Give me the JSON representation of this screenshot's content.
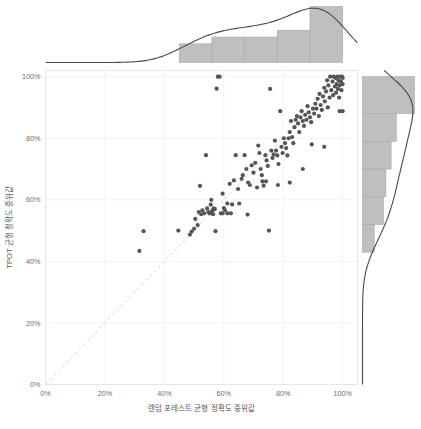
{
  "chart_data": {
    "type": "scatter",
    "title": "",
    "xlabel": "랜덤 포레스트 균형 정확도 중위값",
    "ylabel": "TPOT 균형 정확도 중위값",
    "xlim": [
      0,
      1.05
    ],
    "ylim": [
      0,
      1.02
    ],
    "x_ticks": [
      0,
      0.2,
      0.4,
      0.6,
      0.8,
      1.0
    ],
    "y_ticks": [
      0,
      0.2,
      0.4,
      0.6,
      0.8,
      1.0
    ],
    "x_tick_labels": [
      "0%",
      "20%",
      "40%",
      "60%",
      "80%",
      "100%"
    ],
    "y_tick_labels": [
      "0%",
      "20%",
      "40%",
      "60%",
      "80%",
      "100%"
    ],
    "grid": true,
    "legend": "none",
    "annotations": [
      {
        "type": "reference-line",
        "label": "y = x identity line",
        "style": "dashed",
        "color": "#d8d2d2"
      }
    ],
    "marker_color": "#555555",
    "marker_size": 2.1,
    "points": [
      [
        0.316,
        0.434
      ],
      [
        0.33,
        0.498
      ],
      [
        0.447,
        0.5
      ],
      [
        0.486,
        0.487
      ],
      [
        0.492,
        0.497
      ],
      [
        0.5,
        0.506
      ],
      [
        0.504,
        0.538
      ],
      [
        0.512,
        0.518
      ],
      [
        0.516,
        0.56
      ],
      [
        0.52,
        0.645
      ],
      [
        0.524,
        0.553
      ],
      [
        0.528,
        0.566
      ],
      [
        0.534,
        0.556
      ],
      [
        0.54,
        0.745
      ],
      [
        0.544,
        0.572
      ],
      [
        0.548,
        0.56
      ],
      [
        0.552,
        0.556
      ],
      [
        0.556,
        0.584
      ],
      [
        0.558,
        0.6
      ],
      [
        0.56,
        0.559
      ],
      [
        0.562,
        0.566
      ],
      [
        0.564,
        0.553
      ],
      [
        0.566,
        0.572
      ],
      [
        0.57,
        0.57
      ],
      [
        0.572,
        0.498
      ],
      [
        0.576,
        0.961
      ],
      [
        0.58,
        1.0
      ],
      [
        0.586,
        1.0
      ],
      [
        0.59,
        0.556
      ],
      [
        0.596,
        0.62
      ],
      [
        0.6,
        0.573
      ],
      [
        0.604,
        0.566
      ],
      [
        0.612,
        0.588
      ],
      [
        0.62,
        0.652
      ],
      [
        0.628,
        0.585
      ],
      [
        0.634,
        0.663
      ],
      [
        0.64,
        0.745
      ],
      [
        0.648,
        0.635
      ],
      [
        0.652,
        0.588
      ],
      [
        0.66,
        0.668
      ],
      [
        0.664,
        0.68
      ],
      [
        0.67,
        0.745
      ],
      [
        0.676,
        0.7
      ],
      [
        0.682,
        0.656
      ],
      [
        0.688,
        0.648
      ],
      [
        0.694,
        0.712
      ],
      [
        0.7,
        0.688
      ],
      [
        0.706,
        0.72
      ],
      [
        0.712,
        0.64
      ],
      [
        0.716,
        0.776
      ],
      [
        0.72,
        0.752
      ],
      [
        0.724,
        0.7
      ],
      [
        0.728,
        0.68
      ],
      [
        0.73,
        0.66
      ],
      [
        0.734,
        0.646
      ],
      [
        0.74,
        0.745
      ],
      [
        0.744,
        0.728
      ],
      [
        0.748,
        0.71
      ],
      [
        0.752,
        0.5
      ],
      [
        0.756,
        0.96
      ],
      [
        0.76,
        0.76
      ],
      [
        0.764,
        0.736
      ],
      [
        0.768,
        0.748
      ],
      [
        0.772,
        0.792
      ],
      [
        0.776,
        0.76
      ],
      [
        0.78,
        0.744
      ],
      [
        0.784,
        0.716
      ],
      [
        0.79,
        0.888
      ],
      [
        0.794,
        0.772
      ],
      [
        0.798,
        0.752
      ],
      [
        0.802,
        0.8
      ],
      [
        0.806,
        0.784
      ],
      [
        0.81,
        0.768
      ],
      [
        0.814,
        0.744
      ],
      [
        0.818,
        0.8
      ],
      [
        0.822,
        0.82
      ],
      [
        0.826,
        0.856
      ],
      [
        0.83,
        0.804
      ],
      [
        0.834,
        0.784
      ],
      [
        0.838,
        0.836
      ],
      [
        0.842,
        0.86
      ],
      [
        0.846,
        0.872
      ],
      [
        0.85,
        0.848
      ],
      [
        0.854,
        0.82
      ],
      [
        0.858,
        0.868
      ],
      [
        0.862,
        0.888
      ],
      [
        0.866,
        0.856
      ],
      [
        0.87,
        0.84
      ],
      [
        0.874,
        0.876
      ],
      [
        0.878,
        0.86
      ],
      [
        0.882,
        0.904
      ],
      [
        0.886,
        0.884
      ],
      [
        0.89,
        0.868
      ],
      [
        0.894,
        0.852
      ],
      [
        0.896,
        0.78
      ],
      [
        0.9,
        0.896
      ],
      [
        0.904,
        0.88
      ],
      [
        0.908,
        0.912
      ],
      [
        0.912,
        0.896
      ],
      [
        0.916,
        0.928
      ],
      [
        0.92,
        0.872
      ],
      [
        0.922,
        0.944
      ],
      [
        0.926,
        0.908
      ],
      [
        0.93,
        0.892
      ],
      [
        0.934,
        0.936
      ],
      [
        0.938,
        0.964
      ],
      [
        0.94,
        0.92
      ],
      [
        0.944,
        0.952
      ],
      [
        0.948,
        0.988
      ],
      [
        0.95,
        0.9
      ],
      [
        0.952,
        0.972
      ],
      [
        0.956,
        0.932
      ],
      [
        0.958,
        1.0
      ],
      [
        0.962,
        0.956
      ],
      [
        0.966,
        0.984
      ],
      [
        0.968,
        0.94
      ],
      [
        0.97,
        1.0
      ],
      [
        0.974,
        0.968
      ],
      [
        0.976,
        0.996
      ],
      [
        0.978,
        0.948
      ],
      [
        0.98,
        0.976
      ],
      [
        0.982,
        1.0
      ],
      [
        0.984,
        0.96
      ],
      [
        0.986,
        0.988
      ],
      [
        0.988,
        0.932
      ],
      [
        0.99,
        0.972
      ],
      [
        0.992,
        1.0
      ],
      [
        0.994,
        0.984
      ],
      [
        0.996,
        0.956
      ],
      [
        0.998,
        1.0
      ],
      [
        1.0,
        0.996
      ],
      [
        1.0,
        0.976
      ],
      [
        1.0,
        0.888
      ],
      [
        0.99,
        0.888
      ],
      [
        0.938,
        0.772
      ],
      [
        0.866,
        0.7
      ],
      [
        0.822,
        0.656
      ],
      [
        0.782,
        0.648
      ],
      [
        0.742,
        0.66
      ],
      [
        0.68,
        0.552
      ],
      [
        0.624,
        0.556
      ],
      [
        0.612,
        0.556
      ],
      [
        0.596,
        0.556
      ]
    ],
    "top_marginal": {
      "type": "histogram",
      "orientation": "vertical",
      "bin_edges": [
        0.45,
        0.56,
        0.67,
        0.78,
        0.89,
        1.0
      ],
      "counts": [
        11,
        15,
        15,
        19,
        33
      ],
      "density_curve": true,
      "fill_color": "#bfbfbf",
      "line_color": "#4a4a4a"
    },
    "right_marginal": {
      "type": "histogram",
      "orientation": "horizontal",
      "bin_edges": [
        0.43,
        0.52,
        0.61,
        0.7,
        0.79,
        0.88,
        1.0
      ],
      "counts": [
        9,
        16,
        18,
        22,
        26,
        40
      ],
      "density_curve": true,
      "fill_color": "#bfbfbf",
      "line_color": "#4a4a4a"
    }
  },
  "colors": {
    "background": "#ffffff",
    "grid": "#f0f0f0",
    "panel_border": "#e3e3e3",
    "marker": "#555555",
    "reference_line": "#d8d2d2",
    "histogram_fill": "#bfbfbf",
    "density_line": "#4a4a4a",
    "tick_text": "#6e6e6e",
    "axis_title_text": "#5a5a5a"
  }
}
